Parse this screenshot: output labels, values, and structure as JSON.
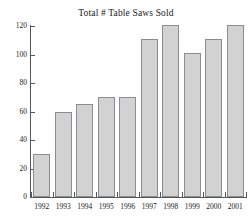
{
  "chart_data": {
    "type": "bar",
    "title": "Total # Table Saws Sold",
    "xlabel": "",
    "ylabel": "",
    "categories": [
      "1992",
      "1993",
      "1994",
      "1995",
      "1996",
      "1997",
      "1998",
      "1999",
      "2000",
      "2001"
    ],
    "values": [
      30,
      60,
      65,
      70,
      70,
      111,
      121,
      101,
      111,
      121
    ],
    "ylim": [
      0,
      120
    ],
    "yticks": [
      0,
      20,
      40,
      60,
      80,
      100,
      120
    ],
    "ytick_labels": [
      "0",
      "20",
      "40",
      "60",
      "80",
      "100",
      "120"
    ],
    "grid": false,
    "legend": null,
    "bar_fill_color": "#d2d2d2",
    "bar_border_color": "#8a8d8f",
    "axis_color": "#55585a",
    "background_color": "#ffffff"
  }
}
